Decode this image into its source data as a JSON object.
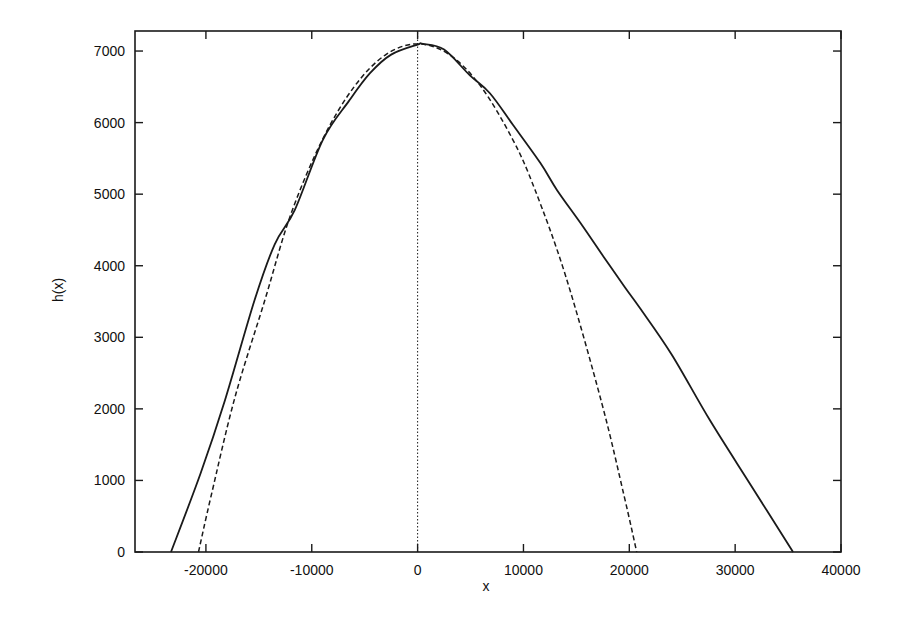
{
  "chart_data": {
    "type": "line",
    "title": "",
    "xlabel": "x",
    "ylabel": "h(x)",
    "xlim": [
      -26700,
      40000
    ],
    "ylim": [
      0,
      7280
    ],
    "grid": false,
    "legend": null,
    "x_ticks": [
      -20000,
      -10000,
      0,
      10000,
      20000,
      30000,
      40000
    ],
    "x_tick_labels": [
      "-20000",
      "-10000",
      "0",
      "10000",
      "20000",
      "30000",
      "40000"
    ],
    "y_ticks": [
      0,
      1000,
      2000,
      3000,
      4000,
      5000,
      6000,
      7000
    ],
    "y_tick_labels": [
      "0",
      "1000",
      "2000",
      "3000",
      "4000",
      "5000",
      "6000",
      "7000"
    ],
    "series": [
      {
        "name": "solid",
        "style": "solid",
        "points": [
          [
            -23300,
            0
          ],
          [
            -20500,
            1100
          ],
          [
            -18200,
            2120
          ],
          [
            -15400,
            3520
          ],
          [
            -13500,
            4300
          ],
          [
            -11600,
            4780
          ],
          [
            -8950,
            5760
          ],
          [
            -6500,
            6300
          ],
          [
            -4500,
            6690
          ],
          [
            -2500,
            6950
          ],
          [
            0,
            7090
          ],
          [
            500,
            7100
          ],
          [
            2500,
            7020
          ],
          [
            4940,
            6660
          ],
          [
            6830,
            6410
          ],
          [
            9000,
            5970
          ],
          [
            11600,
            5435
          ],
          [
            13160,
            5060
          ],
          [
            15520,
            4570
          ],
          [
            17600,
            4120
          ],
          [
            19580,
            3700
          ],
          [
            21000,
            3410
          ],
          [
            24000,
            2760
          ],
          [
            27620,
            1840
          ],
          [
            31500,
            930
          ],
          [
            35470,
            0
          ]
        ]
      },
      {
        "name": "dashed",
        "style": "dashed",
        "peak": 7100,
        "half_width": 20700,
        "points": [
          [
            -20700,
            0
          ],
          [
            -19500,
            790
          ],
          [
            -17260,
            2160
          ],
          [
            -14430,
            3520
          ],
          [
            -12000,
            4710
          ],
          [
            -9000,
            5760
          ],
          [
            -6000,
            6500
          ],
          [
            -3000,
            6950
          ],
          [
            0,
            7100
          ],
          [
            3000,
            6950
          ],
          [
            6000,
            6500
          ],
          [
            9000,
            5760
          ],
          [
            11080,
            5065
          ],
          [
            14000,
            3850
          ],
          [
            17400,
            2080
          ],
          [
            19500,
            790
          ],
          [
            20700,
            0
          ]
        ]
      },
      {
        "name": "zero-line",
        "style": "dotted",
        "points": [
          [
            0,
            0
          ],
          [
            0,
            7280
          ]
        ]
      }
    ]
  }
}
